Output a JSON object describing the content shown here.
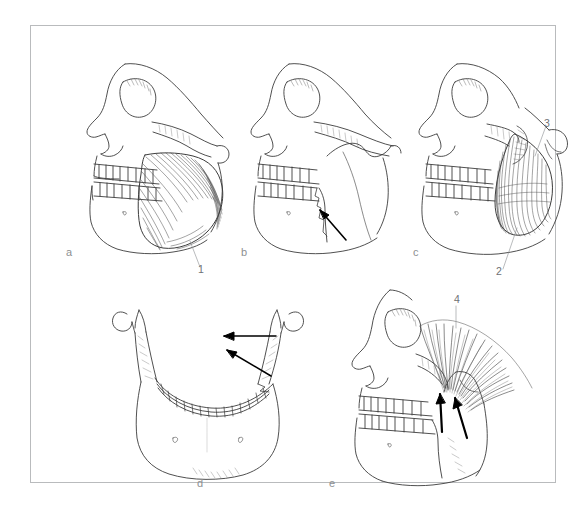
{
  "figure": {
    "frame_color": "#b9bbbd",
    "background_color": "#ffffff",
    "line_color": "#3c3c3c",
    "label_color": "#8d9092"
  },
  "panels": [
    {
      "letter": "a",
      "caption": "Lateral skull with masseter muscle",
      "callouts": [
        {
          "text": "1",
          "meaning": "masseter-muscle"
        }
      ],
      "arrows": []
    },
    {
      "letter": "b",
      "caption": "Lateral skull, muscles removed, with force arrow",
      "callouts": [],
      "arrows": [
        {
          "direction": "up-left",
          "meaning": "elevation-force"
        }
      ]
    },
    {
      "letter": "c",
      "caption": "Lateral skull with medial pterygoid muscle",
      "callouts": [
        {
          "text": "2",
          "meaning": "medial-pterygoid-insertion"
        },
        {
          "text": "3",
          "meaning": "medial-pterygoid-origin"
        }
      ],
      "arrows": []
    },
    {
      "letter": "d",
      "caption": "Anterior view of mandible with medial pull arrows",
      "callouts": [],
      "arrows": [
        {
          "direction": "left",
          "meaning": "medial-pull-horizontal"
        },
        {
          "direction": "up-left",
          "meaning": "medial-pull-oblique"
        }
      ]
    },
    {
      "letter": "e",
      "caption": "Lateral skull with temporalis muscle",
      "callouts": [
        {
          "text": "4",
          "meaning": "temporalis-muscle"
        }
      ],
      "arrows": [
        {
          "direction": "up",
          "meaning": "temporalis-fiber-pull-anterior"
        },
        {
          "direction": "up",
          "meaning": "temporalis-fiber-pull-posterior"
        }
      ]
    }
  ]
}
